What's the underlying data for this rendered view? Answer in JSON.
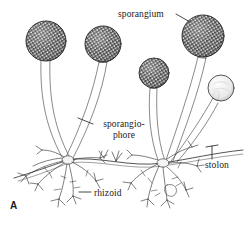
{
  "figure": {
    "panel_label": "A",
    "organism": "bread mold (Rhizopus) thallus",
    "ink_color": "#1a1a1a",
    "background_color": "#ffffff"
  },
  "labels": {
    "sporangium": "sporangium",
    "sporangiophore_line1": "sporangio-",
    "sporangiophore_line2": "phore",
    "stolon": "stolon",
    "rhizoid": "rhizoid"
  },
  "structures": {
    "sporangia": [
      {
        "name": "sporangium-1",
        "state": "mature",
        "cx": 46,
        "cy": 41,
        "r": 20,
        "fill": "#3a3a3a",
        "speckled": true
      },
      {
        "name": "sporangium-2",
        "state": "mature",
        "cx": 103,
        "cy": 44,
        "r": 18,
        "fill": "#3a3a3a",
        "speckled": true
      },
      {
        "name": "sporangium-3",
        "state": "mature",
        "cx": 154,
        "cy": 73,
        "r": 15,
        "fill": "#3a3a3a",
        "speckled": true
      },
      {
        "name": "sporangium-4",
        "state": "mature",
        "cx": 203,
        "cy": 36,
        "r": 21,
        "fill": "#3a3a3a",
        "speckled": true
      },
      {
        "name": "sporangium-5",
        "state": "immature",
        "cx": 221,
        "cy": 88,
        "r": 13,
        "fill": "#ededed",
        "speckled": false
      }
    ],
    "nodes": [
      {
        "name": "rhizoid-node-left",
        "x": 68,
        "y": 160
      },
      {
        "name": "rhizoid-node-right",
        "x": 163,
        "y": 163
      }
    ],
    "stolon_path": "M 14,178 C 40,170 56,163 68,160 C 96,155 130,168 163,163 C 190,159 214,153 243,150"
  },
  "leaders": {
    "sporangium": {
      "from_x": 176,
      "from_y": 15,
      "to_x": 189,
      "to_y": 24
    },
    "sporangiophore": {
      "from_x": 93,
      "from_y": 124,
      "to_x": 78,
      "to_y": 118
    },
    "stolon": {
      "from_x": 212,
      "from_y": 158,
      "to_x": 212,
      "to_y": 146
    },
    "rhizoid": {
      "from_x": 91,
      "from_y": 193,
      "to_x": 79,
      "to_y": 193
    }
  }
}
